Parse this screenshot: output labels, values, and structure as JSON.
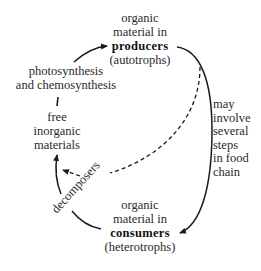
{
  "diagram": {
    "nodes": {
      "producers": {
        "lines": [
          "organic",
          "material in",
          "producers",
          "(autotrophs)"
        ]
      },
      "inorganic": {
        "lines": [
          "free",
          "inorganic",
          "materials"
        ]
      },
      "consumers": {
        "lines": [
          "organic",
          "material in",
          "consumers",
          "(heterotrophs)"
        ]
      }
    },
    "edge_labels": {
      "photosynthesis": [
        "photosynthesis",
        "and chemosynthesis"
      ],
      "food_chain": [
        "may",
        "involve",
        "several",
        "steps",
        "in food",
        "chain"
      ],
      "decomposers": "decomposers"
    },
    "edges": [
      {
        "from": "inorganic",
        "to": "producers",
        "style": "solid",
        "label": "photosynthesis and chemosynthesis"
      },
      {
        "from": "producers",
        "to": "consumers",
        "style": "solid",
        "label": "may involve several steps in food chain"
      },
      {
        "from": "producers",
        "to": "inorganic",
        "style": "dashed",
        "label": "decomposers"
      },
      {
        "from": "consumers",
        "to": "inorganic",
        "style": "solid",
        "label": "decomposers"
      }
    ],
    "colors": {
      "ink": "#1a1a1a",
      "background": "#ffffff"
    }
  }
}
